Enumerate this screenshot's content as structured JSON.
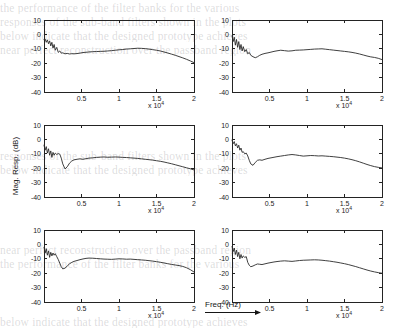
{
  "figure": {
    "caption_y": "Mag. Resp. (dB)",
    "caption_x": "Freq. (Hz)",
    "exponent_label": "x 10",
    "exponent_power": "4"
  },
  "ghost_text": [
    "the performance of the filter banks for the various",
    "responses of the sub-band filters shown in the plots",
    "below indicate that the designed prototype achieves",
    "near perfect reconstruction over the passband region"
  ],
  "chart_data": {
    "type": "line",
    "title": "",
    "xlabel": "Freq. (Hz)",
    "ylabel": "Mag. Resp. (dB)",
    "xlim": [
      0,
      20000
    ],
    "ylim": [
      -40,
      10
    ],
    "xticks": [
      5000,
      10000,
      15000,
      20000
    ],
    "xticklabels": [
      "0.5",
      "1",
      "1.5",
      "2"
    ],
    "x_multiplier": "x 10^4",
    "yticks": [
      10,
      0,
      -10,
      -20,
      -30,
      -40
    ],
    "yticklabels": [
      "10",
      "0",
      "-10",
      "-20",
      "-30",
      "-40"
    ],
    "grid": false,
    "legend": false,
    "panel_layout": {
      "rows": 3,
      "cols": 2
    },
    "panels": [
      {
        "id": "panel-r1c1",
        "row": 1,
        "col": 1,
        "x": [
          0,
          150,
          300,
          450,
          600,
          750,
          900,
          1050,
          1200,
          1350,
          1500,
          1700,
          1900,
          2100,
          2300,
          2500,
          2800,
          3100,
          3400,
          3700,
          4000,
          4400,
          4800,
          5200,
          5600,
          6000,
          6500,
          7000,
          7500,
          8000,
          8500,
          9000,
          9500,
          10000,
          10500,
          11000,
          11500,
          12000,
          12500,
          13000,
          13500,
          14000,
          14500,
          15000,
          15500,
          16000,
          16500,
          17000,
          17500,
          18000,
          18500,
          19000,
          19500,
          20000
        ],
        "y": [
          -3.5,
          -3.2,
          -5.5,
          -3.8,
          -6.5,
          -4.5,
          -8.0,
          -5.5,
          -9.5,
          -7.0,
          -11.0,
          -9.0,
          -12.5,
          -11.5,
          -13.0,
          -12.8,
          -13.5,
          -13.2,
          -13.6,
          -13.4,
          -13.5,
          -13.3,
          -13.0,
          -12.6,
          -12.4,
          -12.2,
          -12.0,
          -11.9,
          -11.8,
          -11.7,
          -11.5,
          -11.3,
          -11.0,
          -10.7,
          -10.5,
          -10.2,
          -10.0,
          -9.8,
          -9.6,
          -9.7,
          -9.9,
          -10.2,
          -10.6,
          -11.0,
          -11.5,
          -12.2,
          -12.9,
          -13.7,
          -14.5,
          -15.4,
          -16.3,
          -17.3,
          -18.4,
          -19.6
        ]
      },
      {
        "id": "panel-r1c2",
        "row": 1,
        "col": 2,
        "x": [
          0,
          150,
          300,
          450,
          600,
          750,
          900,
          1050,
          1200,
          1350,
          1500,
          1700,
          1900,
          2100,
          2300,
          2500,
          2800,
          3100,
          3400,
          3700,
          4000,
          4400,
          4800,
          5200,
          5600,
          6000,
          6500,
          7000,
          7500,
          8000,
          8500,
          9000,
          9500,
          10000,
          10500,
          11000,
          11500,
          12000,
          12500,
          13000,
          13500,
          14000,
          14500,
          15000,
          15500,
          16000,
          16500,
          17000,
          17500,
          18000,
          18500,
          19000,
          19500,
          20000
        ],
        "y": [
          -1.0,
          -5.0,
          -2.0,
          -7.5,
          -3.5,
          -9.0,
          -5.0,
          -10.5,
          -7.0,
          -11.5,
          -8.5,
          -12.0,
          -10.5,
          -13.5,
          -12.5,
          -14.5,
          -15.5,
          -16.2,
          -15.5,
          -14.5,
          -13.8,
          -13.2,
          -12.8,
          -12.3,
          -11.8,
          -11.4,
          -11.0,
          -11.3,
          -11.6,
          -11.4,
          -11.0,
          -10.9,
          -10.8,
          -10.6,
          -10.4,
          -10.2,
          -10.1,
          -10.0,
          -10.3,
          -10.6,
          -10.9,
          -11.2,
          -11.5,
          -11.8,
          -12.1,
          -12.5,
          -13.0,
          -13.6,
          -14.3,
          -15.0,
          -15.6,
          -16.0,
          -16.6,
          -17.5
        ]
      },
      {
        "id": "panel-r2c1",
        "row": 2,
        "col": 1,
        "x": [
          0,
          150,
          300,
          450,
          600,
          750,
          900,
          1050,
          1200,
          1350,
          1500,
          1700,
          1900,
          2100,
          2300,
          2500,
          2800,
          3100,
          3400,
          3700,
          4000,
          4400,
          4800,
          5200,
          5600,
          6000,
          6500,
          7000,
          7500,
          8000,
          8500,
          9000,
          9500,
          10000,
          10500,
          11000,
          11500,
          12000,
          12500,
          13000,
          13500,
          14000,
          14500,
          15000,
          15500,
          16000,
          16500,
          17000,
          17500,
          18000,
          18500,
          19000,
          19500,
          20000
        ],
        "y": [
          -4.0,
          -7.5,
          -5.0,
          -9.5,
          -6.5,
          -11.0,
          -8.0,
          -12.5,
          -9.0,
          -11.0,
          -9.5,
          -10.5,
          -9.8,
          -10.2,
          -13.0,
          -17.0,
          -20.5,
          -19.0,
          -16.5,
          -15.0,
          -14.2,
          -13.8,
          -13.5,
          -13.8,
          -13.4,
          -13.0,
          -12.8,
          -12.5,
          -12.3,
          -12.2,
          -12.4,
          -12.3,
          -12.2,
          -12.3,
          -12.5,
          -12.6,
          -12.8,
          -13.0,
          -13.2,
          -13.5,
          -13.8,
          -14.1,
          -14.4,
          -14.8,
          -15.2,
          -15.7,
          -16.3,
          -16.9,
          -17.6,
          -18.3,
          -19.0,
          -19.7,
          -20.4,
          -21.2
        ]
      },
      {
        "id": "panel-r2c2",
        "row": 2,
        "col": 2,
        "x": [
          0,
          150,
          300,
          450,
          600,
          750,
          900,
          1050,
          1200,
          1350,
          1500,
          1700,
          1900,
          2100,
          2300,
          2500,
          2800,
          3100,
          3400,
          3700,
          4000,
          4400,
          4800,
          5200,
          5600,
          6000,
          6500,
          7000,
          7500,
          8000,
          8500,
          9000,
          9500,
          10000,
          10500,
          11000,
          11500,
          12000,
          12500,
          13000,
          13500,
          14000,
          14500,
          15000,
          15500,
          16000,
          16500,
          17000,
          17500,
          18000,
          18500,
          19000,
          19500,
          20000
        ],
        "y": [
          -0.5,
          -3.0,
          -1.5,
          -4.5,
          -3.0,
          -6.0,
          -4.0,
          -7.5,
          -6.0,
          -9.0,
          -8.5,
          -10.0,
          -9.5,
          -11.5,
          -14.5,
          -17.0,
          -18.0,
          -16.0,
          -14.5,
          -14.2,
          -14.5,
          -13.8,
          -13.2,
          -12.8,
          -12.4,
          -12.0,
          -11.6,
          -11.2,
          -10.8,
          -10.5,
          -10.8,
          -11.2,
          -11.6,
          -11.4,
          -11.2,
          -11.3,
          -11.5,
          -11.4,
          -11.6,
          -11.8,
          -12.0,
          -12.3,
          -12.6,
          -13.0,
          -13.5,
          -14.1,
          -14.8,
          -15.6,
          -16.5,
          -17.4,
          -18.2,
          -18.9,
          -19.4,
          -19.8
        ]
      },
      {
        "id": "panel-r3c1",
        "row": 3,
        "col": 1,
        "x": [
          0,
          150,
          300,
          450,
          600,
          750,
          900,
          1050,
          1200,
          1350,
          1500,
          1700,
          1900,
          2100,
          2300,
          2500,
          2800,
          3100,
          3400,
          3700,
          4000,
          4400,
          4800,
          5200,
          5600,
          6000,
          6500,
          7000,
          7500,
          8000,
          8500,
          9000,
          9500,
          10000,
          10500,
          11000,
          11500,
          12000,
          12500,
          13000,
          13500,
          14000,
          14500,
          15000,
          15500,
          16000,
          16500,
          17000,
          17500,
          18000,
          18500,
          19000,
          19500,
          20000
        ],
        "y": [
          -2.0,
          -6.0,
          -3.0,
          -7.5,
          -4.5,
          -9.0,
          -5.5,
          -8.0,
          -6.0,
          -7.5,
          -6.5,
          -8.5,
          -10.5,
          -13.0,
          -15.5,
          -17.0,
          -16.5,
          -15.0,
          -13.5,
          -12.5,
          -11.8,
          -11.2,
          -10.6,
          -10.1,
          -9.7,
          -9.5,
          -9.6,
          -9.8,
          -10.0,
          -10.2,
          -10.3,
          -10.4,
          -10.2,
          -10.0,
          -10.1,
          -10.3,
          -10.2,
          -10.4,
          -10.6,
          -10.8,
          -11.0,
          -11.3,
          -11.6,
          -12.0,
          -12.4,
          -12.9,
          -13.4,
          -13.9,
          -14.3,
          -14.7,
          -15.3,
          -16.2,
          -17.5,
          -19.2
        ]
      },
      {
        "id": "panel-r3c2",
        "row": 3,
        "col": 2,
        "x": [
          0,
          150,
          300,
          450,
          600,
          750,
          900,
          1050,
          1200,
          1350,
          1500,
          1700,
          1900,
          2100,
          2300,
          2500,
          2800,
          3100,
          3400,
          3700,
          4000,
          4400,
          4800,
          5200,
          5600,
          6000,
          6500,
          7000,
          7500,
          8000,
          8500,
          9000,
          9500,
          10000,
          10500,
          11000,
          11500,
          12000,
          12500,
          13000,
          13500,
          14000,
          14500,
          15000,
          15500,
          16000,
          16500,
          17000,
          17500,
          18000,
          18500,
          19000,
          19500,
          20000
        ],
        "y": [
          -1.5,
          -5.0,
          -2.5,
          -7.0,
          -4.0,
          -8.5,
          -5.5,
          -10.0,
          -7.0,
          -9.5,
          -8.0,
          -9.0,
          -8.5,
          -12.5,
          -14.5,
          -15.5,
          -15.0,
          -14.2,
          -13.6,
          -13.8,
          -14.0,
          -13.5,
          -13.0,
          -12.6,
          -12.2,
          -11.9,
          -11.6,
          -11.4,
          -11.6,
          -11.8,
          -11.5,
          -11.2,
          -11.0,
          -10.9,
          -10.8,
          -10.7,
          -10.8,
          -11.0,
          -11.3,
          -11.6,
          -12.0,
          -12.4,
          -12.9,
          -13.4,
          -14.0,
          -14.7,
          -15.4,
          -16.2,
          -17.0,
          -17.8,
          -18.5,
          -19.1,
          -19.6,
          -20.0
        ]
      }
    ]
  }
}
